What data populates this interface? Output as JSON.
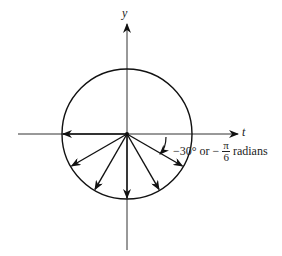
{
  "diagram": {
    "axes": {
      "x_label": "t",
      "y_label": "y"
    },
    "circle": {
      "cx": 127,
      "cy": 134,
      "r": 65
    },
    "vectors_degrees": [
      180,
      -150,
      -120,
      -90,
      -60,
      -30
    ],
    "annotation": {
      "angle_text": "−30° or −",
      "pi": "π",
      "denominator": "6",
      "suffix": "radians"
    }
  }
}
